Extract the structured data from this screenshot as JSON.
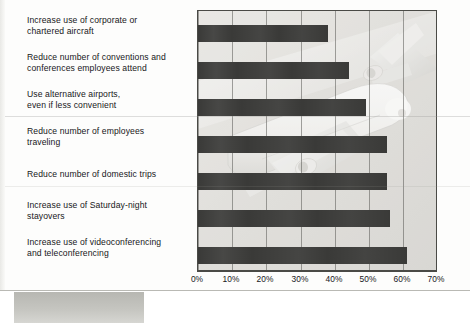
{
  "chart_data": {
    "type": "bar",
    "orientation": "horizontal",
    "title": "",
    "subtitle": "",
    "xlabel": "Percentage of companies taking these steps",
    "ylabel": "",
    "xlim": [
      0,
      70
    ],
    "xticks": [
      0,
      10,
      20,
      30,
      40,
      50,
      60,
      70
    ],
    "xtick_labels": [
      "0%",
      "10%",
      "20%",
      "30%",
      "40%",
      "50%",
      "60%",
      "70%"
    ],
    "grid": "vertical",
    "legend": "none",
    "units": "percent",
    "categories": [
      "Increase use of corporate or chartered aircraft",
      "Reduce number of conventions and conferences employees attend",
      "Use alternative airports, even if less convenient",
      "Reduce number of employees traveling",
      "Reduce number of domestic trips",
      "Increase use of Saturday-night stayovers",
      "Increase use of videoconferencing and teleconferencing"
    ],
    "values": [
      38,
      44,
      49,
      55,
      55,
      56,
      61
    ],
    "bar_color": "#3a3a38",
    "plot_background": "#e6e6e3",
    "background_image": "airplane-photo-watermark"
  },
  "labels": [
    {
      "line1": "Increase use of corporate or",
      "line2": "chartered aircraft"
    },
    {
      "line1": "Reduce number of conventions and",
      "line2": "conferences employees attend"
    },
    {
      "line1": "Use alternative airports,",
      "line2": "even if less convenient"
    },
    {
      "line1": "Reduce number of employees",
      "line2": "traveling"
    },
    {
      "line1": "Reduce number of domestic trips",
      "line2": ""
    },
    {
      "line1": "Increase use of Saturday-night",
      "line2": "stayovers"
    },
    {
      "line1": "Increase use of videoconferencing",
      "line2": "and teleconferencing"
    }
  ],
  "axis": {
    "title": "Percentage of companies taking these steps",
    "ticks": [
      "0%",
      "10%",
      "20%",
      "30%",
      "40%",
      "50%",
      "60%",
      "70%"
    ]
  },
  "colors": {
    "bar": "#3a3a38",
    "plot_bg": "#e6e6e3",
    "frame": "#4a4a46",
    "text": "#17171a",
    "gridline": "#5a5a56"
  }
}
